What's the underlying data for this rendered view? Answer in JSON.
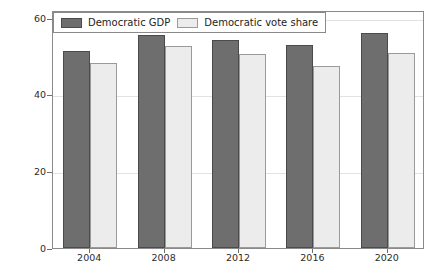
{
  "chart_data": {
    "type": "bar",
    "title": "",
    "subtitle": "",
    "xlabel": "",
    "ylabel": "Percentage",
    "categories": [
      "2004",
      "2008",
      "2012",
      "2016",
      "2020"
    ],
    "series": [
      {
        "name": "Democratic GDP",
        "color": "#6e6e6e",
        "values": [
          51.4,
          55.5,
          54.3,
          52.9,
          56.0
        ]
      },
      {
        "name": "Democratic vote share",
        "color": "#ececec",
        "values": [
          48.3,
          52.6,
          50.5,
          47.5,
          50.8
        ]
      }
    ],
    "ylim": [
      0,
      62
    ],
    "yticks": [
      0,
      20,
      40,
      60
    ],
    "ytick_labels": [
      "0",
      "20",
      "40",
      "60"
    ],
    "grid": true,
    "grid_axis": "y",
    "legend_position": "upper left",
    "frame": true
  },
  "legend": {
    "entries": [
      {
        "label": "Democratic GDP",
        "swatch": "dark-gray-swatch"
      },
      {
        "label": "Democratic vote share",
        "swatch": "light-gray-swatch"
      }
    ]
  },
  "axes": {
    "y_title": "Percentage",
    "y_tick_labels": [
      "60",
      "40",
      "20",
      "0"
    ],
    "x_tick_labels": [
      "2004",
      "2008",
      "2012",
      "2016",
      "2020"
    ]
  }
}
